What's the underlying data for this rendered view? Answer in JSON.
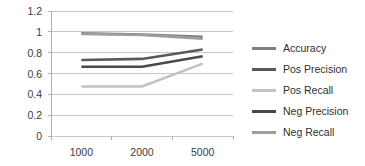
{
  "chart_data": {
    "type": "line",
    "title": "",
    "xlabel": "",
    "ylabel": "",
    "categories": [
      "1000",
      "2000",
      "5000"
    ],
    "x": [
      1000,
      2000,
      5000
    ],
    "ylim": [
      0,
      1.2
    ],
    "yticks": [
      "0",
      "0.2",
      "0.4",
      "0.6",
      "0.8",
      "1",
      "1.2"
    ],
    "ytick_values": [
      0,
      0.2,
      0.4,
      0.6,
      0.8,
      1,
      1.2
    ],
    "grid": "horizontal",
    "legend_position": "right",
    "series": [
      {
        "name": "Accuracy",
        "values": [
          0.985,
          0.975,
          0.952
        ],
        "color": "#808080"
      },
      {
        "name": "Pos Precision",
        "values": [
          0.73,
          0.74,
          0.83
        ],
        "color": "#595959"
      },
      {
        "name": "Pos Recall",
        "values": [
          0.475,
          0.475,
          0.695
        ],
        "color": "#c2c2c2"
      },
      {
        "name": "Neg Precision",
        "values": [
          0.665,
          0.665,
          0.765
        ],
        "color": "#4a4a4a"
      },
      {
        "name": "Neg Recall",
        "values": [
          0.98,
          0.97,
          0.935
        ],
        "color": "#9e9e9e"
      }
    ]
  },
  "axis": {
    "grid_color": "#c8c8c8",
    "axis_color": "#b0b0b0",
    "tick_text_color": "#3a3a3a"
  }
}
